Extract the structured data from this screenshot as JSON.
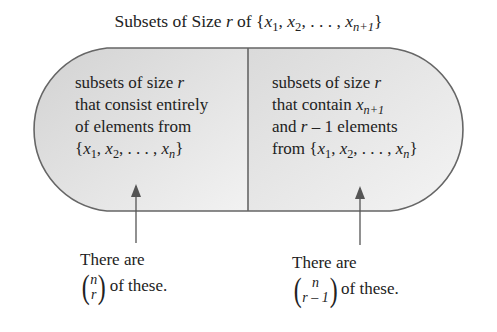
{
  "title": {
    "prefix": "Subsets of Size ",
    "var": "r",
    "middle": " of {",
    "x": "x",
    "s1": "1",
    "s2": "2",
    "ellipsis": ", . . . , ",
    "sn1": "n+1",
    "close": "}"
  },
  "left_box": {
    "line1_prefix": "subsets of size ",
    "line1_var": "r",
    "line2": "that consist entirely",
    "line3": "of elements from",
    "set": "{x1, x2, . . . , xn}"
  },
  "right_box": {
    "line1_prefix": "subsets of size ",
    "line1_var": "r",
    "line2_prefix": "that contain ",
    "line2_var": "x",
    "line2_sub": "n+1",
    "line3_prefix": "and ",
    "line3_var": "r",
    "line3_suffix": " – 1 elements",
    "line4_prefix": "from ",
    "set": "{x1, x2, . . . , xn}"
  },
  "notes": [
    {
      "line1": "There are",
      "binom_top": "n",
      "binom_bottom": "r",
      "suffix": "of these."
    },
    {
      "line1": "There are",
      "binom_top": "n",
      "binom_bottom": "r – 1",
      "suffix": "of these."
    }
  ],
  "colors": {
    "fill_left": "#dcdcdc",
    "fill_right": "#e8e8e8",
    "stroke": "#666666",
    "text": "#222222"
  }
}
